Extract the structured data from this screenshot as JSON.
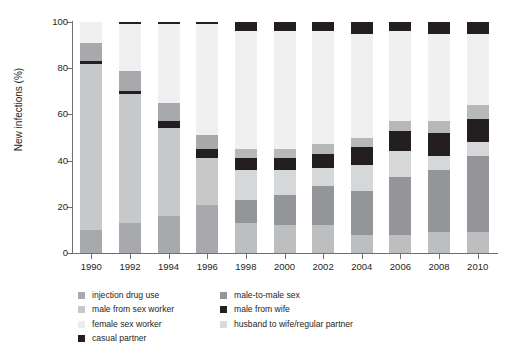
{
  "chart_data": {
    "type": "bar",
    "subtype": "stacked-bar-100-percent",
    "title": "",
    "xlabel": "",
    "ylabel": "New infections (%)",
    "ylim": [
      0,
      100
    ],
    "yticks": [
      0,
      20,
      40,
      60,
      80,
      100
    ],
    "grid": false,
    "legend_position": "below-plot",
    "categories": [
      "1990",
      "1992",
      "1994",
      "1996",
      "1998",
      "2000",
      "2002",
      "2004",
      "2006",
      "2008",
      "2010"
    ],
    "series": [
      {
        "name": "injection drug use",
        "color": "#a7a9ac",
        "values": [
          10,
          13,
          16,
          21,
          13,
          12,
          12,
          8,
          8,
          9,
          9
        ]
      },
      {
        "name": "male-to-male sex",
        "color": "#939598",
        "values": [
          0,
          0,
          0,
          0,
          10,
          13,
          17,
          19,
          25,
          27,
          33
        ]
      },
      {
        "name": "male from sex worker",
        "color": "#c7c8ca",
        "values": [
          72,
          56,
          38,
          20,
          13,
          11,
          8,
          11,
          11,
          6,
          6
        ]
      },
      {
        "name": "casual partner",
        "color": "#231f20",
        "values": [
          1,
          1,
          3,
          4,
          5,
          5,
          6,
          8,
          9,
          10,
          10
        ]
      },
      {
        "name": "male from wife",
        "color": "#a7a9ac",
        "values": [
          8,
          9,
          8,
          6,
          4,
          4,
          4,
          4,
          4,
          5,
          6
        ]
      },
      {
        "name": "female sex worker",
        "color": "#ededed",
        "values": [
          9,
          20,
          34,
          48,
          51,
          51,
          49,
          45,
          39,
          38,
          31
        ]
      },
      {
        "name": "husband to wife/regular partner",
        "color": "#e6e7e8",
        "values": [
          0,
          0,
          0,
          0,
          0,
          0,
          0,
          0,
          0,
          0,
          0
        ]
      },
      {
        "name": "male from wife (top)",
        "color": "#231f20",
        "values": [
          0,
          1,
          1,
          1,
          4,
          4,
          4,
          5,
          4,
          5,
          5
        ]
      }
    ],
    "legend_entries": [
      {
        "label": "injection drug use",
        "color": "#a7a9ac"
      },
      {
        "label": "male-to-male sex",
        "color": "#939598"
      },
      {
        "label": "male from sex worker",
        "color": "#c7c8ca"
      },
      {
        "label": "male from wife",
        "color": "#231f20"
      },
      {
        "label": "female sex worker",
        "color": "#ededed"
      },
      {
        "label": "husband to wife/regular partner",
        "color": "#d9dadb"
      },
      {
        "label": "casual partner",
        "color": "#231f20"
      }
    ]
  },
  "axis": {
    "ylabel": "New infections (%)",
    "ytick_labels": [
      "100",
      "80",
      "60",
      "40",
      "20",
      "0"
    ],
    "xtick_labels": [
      "1990",
      "1992",
      "1994",
      "1996",
      "1998",
      "2000",
      "2002",
      "2004",
      "2006",
      "2008",
      "2010"
    ]
  },
  "legend": {
    "column_left": [
      {
        "label": "injection drug use",
        "color": "#a7a9ac"
      },
      {
        "label": "male from sex worker",
        "color": "#c7c8ca"
      },
      {
        "label": "female sex worker",
        "color": "#ededed"
      },
      {
        "label": "casual partner",
        "color": "#231f20"
      }
    ],
    "column_right": [
      {
        "label": "male-to-male sex",
        "color": "#939598"
      },
      {
        "label": "male from wife",
        "color": "#231f20"
      },
      {
        "label": "husband to wife/regular partner",
        "color": "#d9dadb"
      }
    ]
  },
  "bars": [
    {
      "year": "1990",
      "segments": [
        {
          "series": "injection drug use",
          "value": 10,
          "color": "#a7a9ac"
        },
        {
          "series": "male from sex worker",
          "value": 72,
          "color": "#c7c8ca"
        },
        {
          "series": "casual partner",
          "value": 1,
          "color": "#231f20"
        },
        {
          "series": "male from wife",
          "value": 8,
          "color": "#a7a9ac"
        },
        {
          "series": "female sex worker",
          "value": 9,
          "color": "#f0f0f0"
        }
      ]
    },
    {
      "year": "1992",
      "segments": [
        {
          "series": "injection drug use",
          "value": 13,
          "color": "#a7a9ac"
        },
        {
          "series": "male from sex worker",
          "value": 56,
          "color": "#c7c8ca"
        },
        {
          "series": "casual partner",
          "value": 1,
          "color": "#231f20"
        },
        {
          "series": "male from wife",
          "value": 9,
          "color": "#a7a9ac"
        },
        {
          "series": "female sex worker",
          "value": 20,
          "color": "#f0f0f0"
        },
        {
          "series": "male-to-male sex",
          "value": 1,
          "color": "#231f20"
        }
      ]
    },
    {
      "year": "1994",
      "segments": [
        {
          "series": "injection drug use",
          "value": 16,
          "color": "#a7a9ac"
        },
        {
          "series": "male from sex worker",
          "value": 38,
          "color": "#c7c8ca"
        },
        {
          "series": "casual partner",
          "value": 3,
          "color": "#231f20"
        },
        {
          "series": "male from wife",
          "value": 8,
          "color": "#a7a9ac"
        },
        {
          "series": "female sex worker",
          "value": 34,
          "color": "#f0f0f0"
        },
        {
          "series": "male-to-male sex",
          "value": 1,
          "color": "#231f20"
        }
      ]
    },
    {
      "year": "1996",
      "segments": [
        {
          "series": "injection drug use",
          "value": 21,
          "color": "#a7a9ac"
        },
        {
          "series": "male from sex worker",
          "value": 20,
          "color": "#c7c8ca"
        },
        {
          "series": "casual partner",
          "value": 4,
          "color": "#231f20"
        },
        {
          "series": "male from wife",
          "value": 6,
          "color": "#a7a9ac"
        },
        {
          "series": "female sex worker",
          "value": 48,
          "color": "#f0f0f0"
        },
        {
          "series": "male-to-male sex",
          "value": 1,
          "color": "#231f20"
        }
      ]
    },
    {
      "year": "1998",
      "segments": [
        {
          "series": "injection drug use",
          "value": 13,
          "color": "#bcbec0"
        },
        {
          "series": "male-to-male sex",
          "value": 10,
          "color": "#939598"
        },
        {
          "series": "male from sex worker",
          "value": 13,
          "color": "#d6d7d8"
        },
        {
          "series": "casual partner",
          "value": 5,
          "color": "#231f20"
        },
        {
          "series": "male from wife",
          "value": 4,
          "color": "#b6b8ba"
        },
        {
          "series": "female sex worker",
          "value": 51,
          "color": "#f0f0f0"
        },
        {
          "series": "husband to wife/regular partner",
          "value": 4,
          "color": "#231f20"
        }
      ]
    },
    {
      "year": "2000",
      "segments": [
        {
          "series": "injection drug use",
          "value": 12,
          "color": "#bcbec0"
        },
        {
          "series": "male-to-male sex",
          "value": 13,
          "color": "#939598"
        },
        {
          "series": "male from sex worker",
          "value": 11,
          "color": "#d6d7d8"
        },
        {
          "series": "casual partner",
          "value": 5,
          "color": "#231f20"
        },
        {
          "series": "male from wife",
          "value": 4,
          "color": "#b6b8ba"
        },
        {
          "series": "female sex worker",
          "value": 51,
          "color": "#f0f0f0"
        },
        {
          "series": "husband to wife/regular partner",
          "value": 4,
          "color": "#231f20"
        }
      ]
    },
    {
      "year": "2002",
      "segments": [
        {
          "series": "injection drug use",
          "value": 12,
          "color": "#bcbec0"
        },
        {
          "series": "male-to-male sex",
          "value": 17,
          "color": "#939598"
        },
        {
          "series": "male from sex worker",
          "value": 8,
          "color": "#d6d7d8"
        },
        {
          "series": "casual partner",
          "value": 6,
          "color": "#231f20"
        },
        {
          "series": "male from wife",
          "value": 4,
          "color": "#b6b8ba"
        },
        {
          "series": "female sex worker",
          "value": 49,
          "color": "#f0f0f0"
        },
        {
          "series": "husband to wife/regular partner",
          "value": 4,
          "color": "#231f20"
        }
      ]
    },
    {
      "year": "2004",
      "segments": [
        {
          "series": "injection drug use",
          "value": 8,
          "color": "#bcbec0"
        },
        {
          "series": "male-to-male sex",
          "value": 19,
          "color": "#939598"
        },
        {
          "series": "male from sex worker",
          "value": 11,
          "color": "#d6d7d8"
        },
        {
          "series": "casual partner",
          "value": 8,
          "color": "#231f20"
        },
        {
          "series": "male from wife",
          "value": 4,
          "color": "#b6b8ba"
        },
        {
          "series": "female sex worker",
          "value": 45,
          "color": "#f0f0f0"
        },
        {
          "series": "husband to wife/regular partner",
          "value": 5,
          "color": "#231f20"
        }
      ]
    },
    {
      "year": "2006",
      "segments": [
        {
          "series": "injection drug use",
          "value": 8,
          "color": "#bcbec0"
        },
        {
          "series": "male-to-male sex",
          "value": 25,
          "color": "#939598"
        },
        {
          "series": "male from sex worker",
          "value": 11,
          "color": "#d6d7d8"
        },
        {
          "series": "casual partner",
          "value": 9,
          "color": "#231f20"
        },
        {
          "series": "male from wife",
          "value": 4,
          "color": "#b6b8ba"
        },
        {
          "series": "female sex worker",
          "value": 39,
          "color": "#f0f0f0"
        },
        {
          "series": "husband to wife/regular partner",
          "value": 4,
          "color": "#231f20"
        }
      ]
    },
    {
      "year": "2008",
      "segments": [
        {
          "series": "injection drug use",
          "value": 9,
          "color": "#bcbec0"
        },
        {
          "series": "male-to-male sex",
          "value": 27,
          "color": "#939598"
        },
        {
          "series": "male from sex worker",
          "value": 6,
          "color": "#d6d7d8"
        },
        {
          "series": "casual partner",
          "value": 10,
          "color": "#231f20"
        },
        {
          "series": "male from wife",
          "value": 5,
          "color": "#b6b8ba"
        },
        {
          "series": "female sex worker",
          "value": 38,
          "color": "#f0f0f0"
        },
        {
          "series": "husband to wife/regular partner",
          "value": 5,
          "color": "#231f20"
        }
      ]
    },
    {
      "year": "2010",
      "segments": [
        {
          "series": "injection drug use",
          "value": 9,
          "color": "#bcbec0"
        },
        {
          "series": "male-to-male sex",
          "value": 33,
          "color": "#939598"
        },
        {
          "series": "male from sex worker",
          "value": 6,
          "color": "#d6d7d8"
        },
        {
          "series": "casual partner",
          "value": 10,
          "color": "#231f20"
        },
        {
          "series": "male from wife",
          "value": 6,
          "color": "#b6b8ba"
        },
        {
          "series": "female sex worker",
          "value": 31,
          "color": "#f0f0f0"
        },
        {
          "series": "husband to wife/regular partner",
          "value": 5,
          "color": "#231f20"
        }
      ]
    }
  ]
}
